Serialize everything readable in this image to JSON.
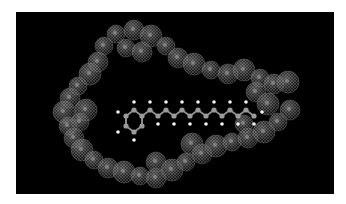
{
  "figure": {
    "background": "#000000",
    "frame": "#ffffff",
    "host_color": "#8a8a8a",
    "guest_atom_color": "#9a9a9a",
    "hydrogen_color": "#f2f2f2"
  }
}
